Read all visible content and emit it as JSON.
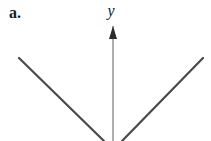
{
  "figure": {
    "part_label": "a.",
    "background_color": "#ffffff",
    "width": 211,
    "height": 141
  },
  "axes": {
    "y_axis": {
      "label": "y",
      "icon": "up-arrow-axis-icon",
      "color": "#8c8c8c",
      "x": 113,
      "top": 26,
      "bottom": 141,
      "arrowhead": {
        "tip_x": 113,
        "tip_y": 26,
        "half_width": 4,
        "height": 13,
        "color": "#2b2b2b"
      }
    }
  },
  "chart_data": {
    "type": "line",
    "title": "",
    "subtitle": "",
    "xlabel": "",
    "ylabel": "y",
    "grid": false,
    "legend": null,
    "annotations": [
      "a."
    ],
    "series": [
      {
        "name": "left-branch",
        "color": "#4a4a4a",
        "points": [
          [
            19,
            58
          ],
          [
            104,
            141
          ]
        ]
      },
      {
        "name": "right-branch",
        "color": "#4a4a4a",
        "points": [
          [
            122,
            141
          ],
          [
            203,
            58
          ]
        ]
      }
    ],
    "xlim": [
      0,
      211
    ],
    "ylim": [
      141,
      0
    ]
  }
}
